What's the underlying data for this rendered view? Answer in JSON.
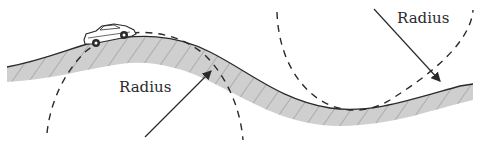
{
  "diagram": {
    "labels": {
      "crest_radius": "Radius",
      "dip_radius": "Radius"
    },
    "elements": [
      "road",
      "car",
      "crest-circle",
      "dip-circle",
      "crest-radius-arrow",
      "dip-radius-arrow"
    ],
    "colors": {
      "road_fill": "#c8c8c8",
      "road_edge": "#2a2a2a",
      "hatch": "#8a8a8a",
      "dashed_circle": "#2a2a2a"
    }
  }
}
